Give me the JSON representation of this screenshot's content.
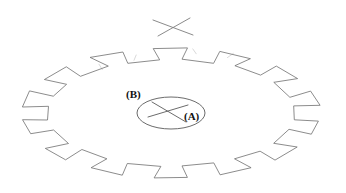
{
  "figure": {
    "kind": "gear-sketch",
    "background_color": "#ffffff",
    "line_color": "#6e6e6e",
    "label_color": "#111111",
    "stroke_width": 0.8,
    "width": 346,
    "height": 193
  },
  "labels": {
    "hub_label": "(A)",
    "body_label": "(B)"
  },
  "annotations": {
    "top_cross_mark": "x-mark",
    "hub_cross_mark": "x-mark"
  },
  "icons": {
    "gear": "gear-outline-icon",
    "hub": "ellipse-hub-icon",
    "cross_top": "x-cross-icon",
    "cross_hub": "x-cross-icon"
  },
  "geometry": {
    "gear": {
      "tooth_count": 14,
      "center": [
        171,
        113
      ],
      "outer_rx": 149,
      "outer_ry": 65,
      "root_rx": 124,
      "root_ry": 54
    },
    "hub_ellipse": {
      "cx": 171,
      "cy": 113,
      "rx": 34,
      "ry": 16
    },
    "top_cross": {
      "line1": [
        153,
        20,
        193,
        35
      ],
      "line2": [
        158,
        36,
        190,
        18
      ]
    },
    "hub_cross": {
      "line1": [
        148,
        117,
        188,
        105
      ],
      "line2": [
        152,
        102,
        186,
        122
      ]
    }
  }
}
